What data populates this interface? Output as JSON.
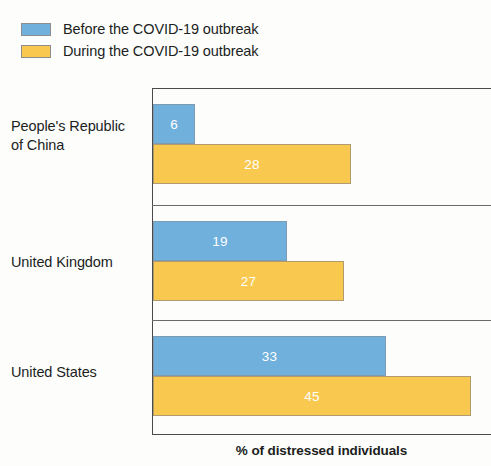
{
  "chart_data": {
    "type": "bar",
    "orientation": "horizontal",
    "title": "",
    "subtitle": "",
    "xlabel": "% of distressed individuals",
    "ylabel": "",
    "categories": [
      "People's Republic of China",
      "United Kingdom",
      "United States"
    ],
    "series": [
      {
        "name": "Before the COVID-19 outbreak",
        "color": "#6fb0dd",
        "values": [
          6,
          19,
          33
        ]
      },
      {
        "name": "During the COVID-19 outbreak",
        "color": "#f9c84f",
        "values": [
          28,
          27,
          45
        ]
      }
    ],
    "xlim": [
      0,
      48
    ],
    "grid": false,
    "legend_position": "top-left",
    "data_labels": true,
    "data_label_color": "#ffffff"
  },
  "legend": {
    "items": [
      {
        "label": "Before the COVID-19 outbreak",
        "swatch": "legend-swatch-before"
      },
      {
        "label": "During the COVID-19 outbreak",
        "swatch": "legend-swatch-during"
      }
    ]
  },
  "categories": {
    "china_line1": "People's Republic",
    "china_line2": "of China",
    "uk": "United Kingdom",
    "us": "United States"
  },
  "values": {
    "china_before": "6",
    "china_during": "28",
    "uk_before": "19",
    "uk_during": "27",
    "us_before": "33",
    "us_during": "45"
  },
  "axis": {
    "x_caption": "% of distressed individuals"
  }
}
